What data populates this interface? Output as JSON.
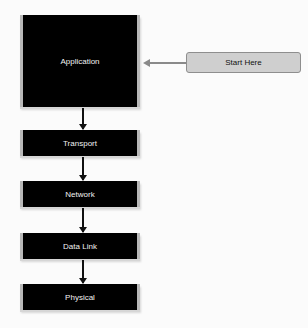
{
  "diagram": {
    "layers": [
      {
        "label": "Application"
      },
      {
        "label": "Transport"
      },
      {
        "label": "Network"
      },
      {
        "label": "Data Link"
      },
      {
        "label": "Physical"
      }
    ],
    "start": {
      "label": "Start Here"
    }
  }
}
